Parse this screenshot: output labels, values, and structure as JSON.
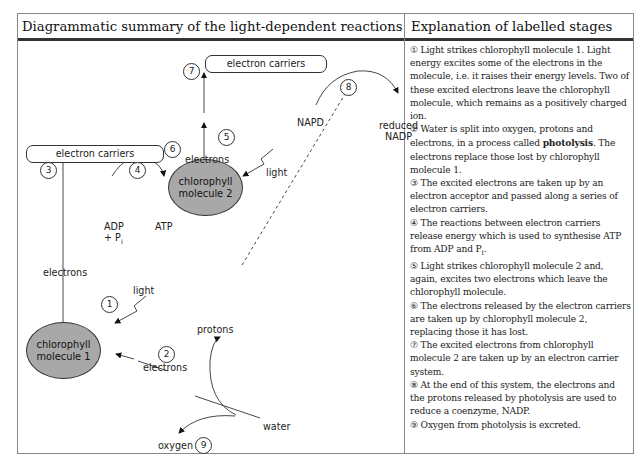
{
  "header": {
    "left_title": "Diagrammatic summary of the light-dependent reactions",
    "right_title": "Explanation of labelled stages"
  },
  "diagram": {
    "carriers_top": "electron carriers",
    "carriers_mid": "electron carriers",
    "chloro2_line1": "chlorophyll",
    "chloro2_line2": "molecule 2",
    "chloro1_line1": "chlorophyll",
    "chloro1_line2": "molecule 1",
    "electrons_top": "electrons",
    "electrons_left": "electrons",
    "electrons_bottom": "electrons",
    "light_2": "light",
    "light_1": "light",
    "napd": "NAPD",
    "reduced_nadp_1": "reduced",
    "reduced_nadp_2": "NADP",
    "adp": "ADP",
    "pi": "+ P",
    "pi_sub": "i",
    "atp": "ATP",
    "protons": "protons",
    "water": "water",
    "oxygen": "oxygen",
    "numbers": [
      "1",
      "2",
      "3",
      "4",
      "5",
      "6",
      "7",
      "8",
      "9"
    ]
  },
  "explanation": {
    "s1": "① Light strikes chlorophyll molecule 1. Light energy excites some of the electrons in the molecule, i.e. it raises their energy levels. Two of these excited electrons leave the chlorophyll molecule, which remains as a positively charged ion.",
    "s2_a": "② Water is split into oxygen, protons and electrons, in a process called ",
    "s2_bold": "photolysis",
    "s2_b": ". The electrons replace those lost by chlorophyll molecule 1.",
    "s3": "③ The excited electrons are taken up by an electron acceptor and passed along a series of electron carriers.",
    "s4_a": "④ The reactions between electron carriers release energy which is used to synthesise ATP from ADP and P",
    "s4_sub": "i",
    "s4_b": ".",
    "s5": "⑤ Light strikes chlorophyll molecule 2 and, again, excites two electrons which leave the chlorophyll molecule.",
    "s6": "⑥ The electrons released by the electron carriers are taken up by chlorophyll molecule 2, replacing those it has lost.",
    "s7": "⑦ The excited electrons from chlorophyll molecule 2 are taken up by an electron carrier system.",
    "s8": "⑧ At the end of this system, the electrons and the protons released by photolysis are used to reduce a coenzyme, NADP.",
    "s9": "⑨ Oxygen from photolysis is excreted."
  }
}
